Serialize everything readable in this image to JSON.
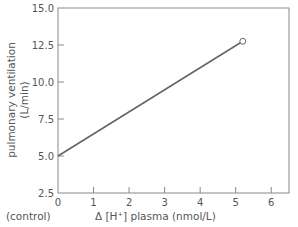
{
  "chart_data": {
    "type": "line",
    "title": "",
    "xlabel": "Δ [H⁺] plasma (nmol/L)",
    "xlabel_prefix": "(control)",
    "ylabel": "pulmonary ventilation",
    "ylabel_units": "(L/min)",
    "xlim": [
      0,
      6.5
    ],
    "ylim": [
      2.5,
      15.0
    ],
    "x_ticks": [
      "0",
      "1",
      "2",
      "3",
      "4",
      "5",
      "6"
    ],
    "y_ticks": [
      "2.5",
      "5.0",
      "7.5",
      "10.0",
      "12.5",
      "15.0"
    ],
    "grid": false,
    "legend": null,
    "series": [
      {
        "name": "ventilation response",
        "x": [
          0,
          5.2
        ],
        "y": [
          5.0,
          12.75
        ],
        "end_marker": "open-circle"
      }
    ],
    "colors": {
      "line": "#666666",
      "axis": "#777777",
      "text": "#555555"
    }
  }
}
